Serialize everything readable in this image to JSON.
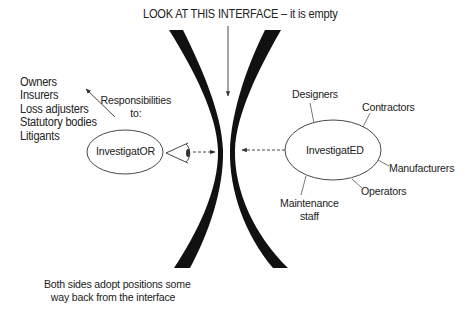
{
  "diagram": {
    "title": "LOOK AT THIS INTERFACE – it is empty",
    "left_side": {
      "node_label": "InvestigatOR",
      "responsibilities_label": [
        "Responsibilities",
        "to:"
      ],
      "responsibilities_list": [
        "Owners",
        "Insurers",
        "Loss adjusters",
        "Statutory bodies",
        "Litigants"
      ],
      "icon": "eye-icon"
    },
    "right_side": {
      "node_label": "InvestigatED",
      "stakeholders": {
        "designers": "Designers",
        "contractors": "Contractors",
        "manufacturers": "Manufacturers",
        "operators": "Operators",
        "maintenance": [
          "Maintenance",
          "staff"
        ]
      }
    },
    "interface": {
      "description": "Two black curved bands bowing toward each other, empty gap between them",
      "fill_color": "#111111"
    },
    "footer": [
      "Both sides adopt positions some",
      "way back from the interface"
    ],
    "colors": {
      "background": "#ffffff",
      "text": "#222222",
      "line": "#333333",
      "band": "#111111"
    }
  }
}
